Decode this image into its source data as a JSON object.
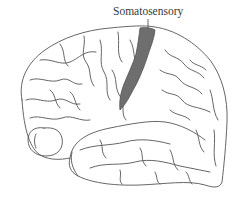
{
  "diagram": {
    "type": "brain-lateral-view",
    "labels": [
      {
        "text": "Somatosensory",
        "target": "somatosensory-cortex"
      }
    ],
    "highlighted_region": {
      "name": "Somatosensory",
      "color": "#6e6e6e"
    },
    "line_color": "#555555",
    "background": "#ffffff"
  }
}
